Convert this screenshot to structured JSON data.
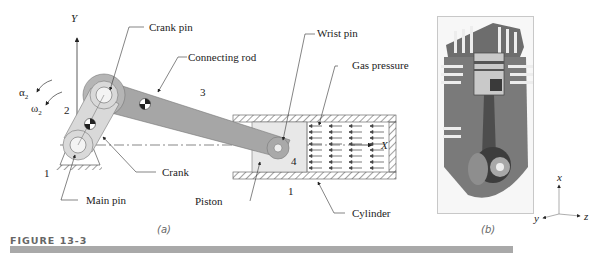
{
  "figure": {
    "caption": "FIGURE 13-3",
    "caption_bar_color": "#a9a9a9",
    "panel_a": {
      "sublabel": "(a)",
      "axes": {
        "y": "Y",
        "x": "X"
      },
      "angular": {
        "alpha": "α",
        "alpha_sub": "2",
        "omega": "ω",
        "omega_sub": "2"
      },
      "link_numbers": {
        "ground_left": "1",
        "crank": "2",
        "rod": "3",
        "piston": "4",
        "ground_bottom": "1"
      },
      "callouts": {
        "crank_pin": "Crank pin",
        "connecting_rod": "Connecting rod",
        "wrist_pin": "Wrist pin",
        "gas_pressure": "Gas pressure",
        "crank": "Crank",
        "main_pin": "Main pin",
        "piston": "Piston",
        "cylinder": "Cylinder"
      },
      "colors": {
        "crank": "#d9d9d9",
        "rod": "#a6a6a6",
        "crank_pin_disc": "#b5b5b5",
        "piston": "#e8e8e8"
      }
    },
    "panel_b": {
      "sublabel": "(b)",
      "axes": {
        "x": "x",
        "y": "y",
        "z": "z"
      },
      "description": "cutaway engine photo"
    }
  }
}
